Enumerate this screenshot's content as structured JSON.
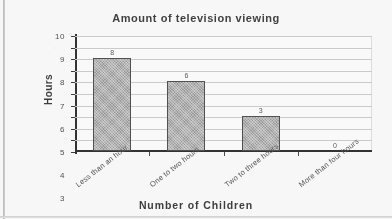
{
  "chart_data": {
    "type": "bar",
    "title": "Amount of television viewing",
    "xlabel": "Number of Children",
    "ylabel": "Hours",
    "categories": [
      "Less than an hour",
      "One to two hours",
      "Two to three hours",
      "More than four hours"
    ],
    "values": [
      8,
      6,
      3,
      0
    ],
    "value_labels": [
      "8",
      "6",
      "3",
      "0"
    ],
    "ylim": [
      0,
      10
    ],
    "ytick_labels": [
      "10",
      "9",
      "8",
      "7",
      "6",
      "5",
      "4",
      "3",
      "2",
      "1",
      "0"
    ],
    "yticks": [
      10,
      9,
      8,
      7,
      6,
      5,
      4,
      3,
      2,
      1,
      0
    ],
    "grid": true,
    "legend": false,
    "bar_color": "#9b9b9b",
    "bar_edge_color": "#4f4f4f",
    "gridline_color": "#cfcfcf",
    "axis_color": "#2f2f2f",
    "text_color": "#4a4a4a",
    "background_color": "#ffffff"
  }
}
